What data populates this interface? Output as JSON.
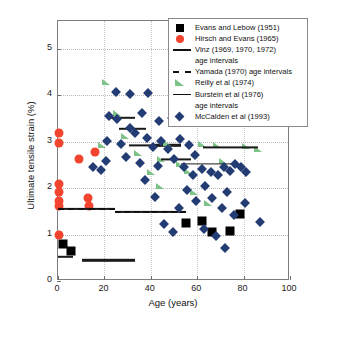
{
  "chart_data": {
    "type": "scatter",
    "title": "",
    "xlabel": "Age (years)",
    "ylabel": "Ultimate tensile strain (%)",
    "xlim": [
      0,
      100
    ],
    "ylim": [
      0,
      5.6
    ],
    "xticks": [
      0,
      20,
      40,
      60,
      80,
      100
    ],
    "yticks": [
      0,
      1,
      2,
      3,
      4,
      5
    ],
    "grid": true,
    "legend_position": "top-right",
    "series": [
      {
        "name": "Evans and Lebow (1951)",
        "marker": "square",
        "color": "#000000",
        "points": [
          [
            55.0,
            1.25
          ],
          [
            62.0,
            1.3
          ],
          [
            66.5,
            1.05
          ],
          [
            74.0,
            1.08
          ],
          [
            78.5,
            1.45
          ],
          [
            2.0,
            0.8
          ],
          [
            5.5,
            0.65
          ]
        ]
      },
      {
        "name": "Hirsch and Evans (1965)",
        "marker": "circle",
        "color": "#f2452f",
        "points": [
          [
            0.5,
            3.18
          ],
          [
            0.5,
            2.98
          ],
          [
            0.5,
            2.08
          ],
          [
            0.5,
            1.92
          ],
          [
            0.5,
            1.72
          ],
          [
            0.5,
            1.62
          ],
          [
            0.5,
            1.0
          ],
          [
            9.0,
            2.62
          ],
          [
            13.0,
            1.78
          ],
          [
            13.5,
            1.62
          ],
          [
            16.0,
            2.78
          ]
        ]
      },
      {
        "name": "Vinz (1969, 1970, 1972) age intervals",
        "marker": "line",
        "color": "#1a1a1a",
        "segments": [
          [
            0.0,
            6.5,
            0.52
          ],
          [
            10.5,
            33.0,
            0.45
          ],
          [
            23.0,
            33.0,
            3.52
          ],
          [
            26.5,
            38.0,
            3.28
          ],
          [
            42.0,
            53.0,
            2.92
          ]
        ]
      },
      {
        "name": "Yamada (1970) age intervals",
        "marker": "dashed-line",
        "color": "#111111",
        "segments": [
          [
            0.0,
            24.5,
            1.55
          ],
          [
            24.5,
            55.0,
            1.48
          ]
        ]
      },
      {
        "name": "Reilly et al (1974)",
        "marker": "triangle",
        "color": "#7dc387",
        "points": [
          [
            20.5,
            4.28
          ],
          [
            25.5,
            3.62
          ],
          [
            29.0,
            3.12
          ],
          [
            19.0,
            2.92
          ],
          [
            34.5,
            2.75
          ],
          [
            44.5,
            2.62
          ],
          [
            47.0,
            2.98
          ],
          [
            52.5,
            2.52
          ],
          [
            56.0,
            2.38
          ],
          [
            62.0,
            2.95
          ],
          [
            68.5,
            2.92
          ],
          [
            71.0,
            2.58
          ],
          [
            58.5,
            1.92
          ],
          [
            64.5,
            1.68
          ],
          [
            81.0,
            2.9
          ],
          [
            86.0,
            2.85
          ],
          [
            44.0,
            2.05
          ],
          [
            40.0,
            2.35
          ]
        ]
      },
      {
        "name": "Burstein et al (1976) age intervals",
        "marker": "thin-line",
        "color": "#1a1a1a",
        "segments": [
          [
            30.5,
            44.5,
            2.92
          ],
          [
            44.5,
            57.5,
            2.62
          ],
          [
            53.0,
            76.0,
            2.52
          ],
          [
            62.5,
            86.0,
            2.88
          ]
        ]
      },
      {
        "name": "McCalden et al (1993)",
        "marker": "diamond",
        "color": "#243c74",
        "points": [
          [
            25.0,
            4.08
          ],
          [
            31.0,
            4.02
          ],
          [
            39.0,
            4.05
          ],
          [
            22.0,
            3.55
          ],
          [
            25.5,
            3.48
          ],
          [
            31.0,
            3.3
          ],
          [
            36.0,
            3.62
          ],
          [
            43.5,
            3.45
          ],
          [
            49.0,
            3.52
          ],
          [
            21.0,
            3.02
          ],
          [
            27.0,
            2.95
          ],
          [
            33.0,
            3.18
          ],
          [
            38.5,
            3.08
          ],
          [
            41.0,
            2.88
          ],
          [
            44.5,
            3.02
          ],
          [
            47.5,
            2.85
          ],
          [
            52.5,
            3.05
          ],
          [
            56.5,
            2.92
          ],
          [
            59.0,
            2.72
          ],
          [
            20.5,
            2.58
          ],
          [
            29.5,
            2.68
          ],
          [
            35.5,
            2.55
          ],
          [
            43.0,
            2.48
          ],
          [
            50.0,
            2.62
          ],
          [
            54.5,
            2.45
          ],
          [
            58.0,
            2.28
          ],
          [
            62.0,
            2.42
          ],
          [
            66.0,
            2.35
          ],
          [
            69.0,
            2.28
          ],
          [
            71.5,
            2.45
          ],
          [
            74.0,
            2.38
          ],
          [
            76.5,
            2.52
          ],
          [
            79.0,
            2.45
          ],
          [
            81.0,
            2.35
          ],
          [
            15.0,
            2.45
          ],
          [
            18.5,
            2.4
          ],
          [
            63.5,
            2.05
          ],
          [
            55.5,
            1.95
          ],
          [
            59.5,
            1.72
          ],
          [
            66.5,
            1.78
          ],
          [
            70.5,
            1.58
          ],
          [
            73.0,
            1.92
          ],
          [
            76.0,
            1.42
          ],
          [
            80.5,
            1.68
          ],
          [
            87.0,
            1.28
          ],
          [
            63.0,
            1.12
          ],
          [
            68.0,
            0.98
          ],
          [
            45.5,
            1.22
          ],
          [
            49.5,
            1.05
          ],
          [
            72.0,
            0.72
          ],
          [
            52.0,
            1.58
          ],
          [
            37.5,
            2.18
          ],
          [
            42.0,
            1.82
          ]
        ]
      }
    ]
  },
  "legend": {
    "entries": [
      {
        "label": "Evans and Lebow (1951)",
        "key": "square-key"
      },
      {
        "label": "Hirsch and Evans (1965)",
        "key": "circle-key"
      },
      {
        "label": "Vinz (1969, 1970, 1972)",
        "key": "solid-line-key"
      },
      {
        "label": "age intervals",
        "key": "none"
      },
      {
        "label": "Yamada (1970) age intervals",
        "key": "dashed-line-key"
      },
      {
        "label": "Reilly et al (1974)",
        "key": "triangle-key"
      },
      {
        "label": "Burstein et al (1976)",
        "key": "thin-line-key"
      },
      {
        "label": "age intervals",
        "key": "none"
      },
      {
        "label": "McCalden et al (1993)",
        "key": "diamond-key"
      }
    ]
  },
  "axes": {
    "x_title": "Age (years)",
    "y_title": "Ultimate tensile strain (%)",
    "x_tick_labels": [
      "0",
      "20",
      "40",
      "60",
      "80",
      "100"
    ],
    "y_tick_labels": [
      "0",
      "1",
      "2",
      "3",
      "4",
      "5"
    ]
  },
  "colors": {
    "square": "#000000",
    "circle": "#f2452f",
    "triangle": "#7dc387",
    "diamond": "#243c74",
    "line": "#1a1a1a",
    "frame": "#7d7d7d",
    "grid": "#b9b9b9"
  }
}
